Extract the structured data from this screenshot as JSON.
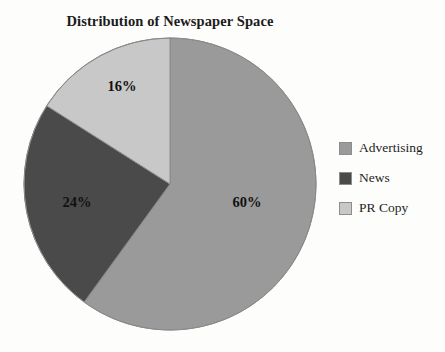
{
  "chart_data": {
    "type": "pie",
    "title": "Distribution of Newspaper Space",
    "categories": [
      "Advertising",
      "News",
      "PR Copy"
    ],
    "values": [
      60,
      24,
      16
    ],
    "value_labels": [
      "60%",
      "24%",
      "16%"
    ],
    "units": "percent",
    "total": 100,
    "start_angle_deg": 0,
    "direction": "clockwise",
    "legend_position": "right",
    "grid": false,
    "xlabel": "",
    "ylabel": "",
    "slices": [
      {
        "name": "Advertising",
        "value": 60,
        "label": "60%",
        "color": "#9a9a9a",
        "start_deg": 0,
        "end_deg": 216,
        "label_x": 225,
        "label_y": 168
      },
      {
        "name": "News",
        "value": 24,
        "label": "24%",
        "color": "#4a4a4a",
        "start_deg": 216,
        "end_deg": 302.4,
        "label_x": 55,
        "label_y": 168
      },
      {
        "name": "PR Copy",
        "value": 16,
        "label": "16%",
        "color": "#c8c8c8",
        "start_deg": 302.4,
        "end_deg": 360,
        "label_x": 100,
        "label_y": 52
      }
    ]
  },
  "chart": {
    "title": "Distribution of Newspaper Space",
    "pie": {
      "center_x": 148,
      "center_y": 148,
      "radius": 146,
      "outline_color": "#8a8a8a"
    },
    "labels": {
      "advertising_pct": "60%",
      "news_pct": "24%",
      "prcopy_pct": "16%"
    }
  },
  "legend": {
    "items": [
      {
        "label": "Advertising",
        "color": "#9a9a9a"
      },
      {
        "label": "News",
        "color": "#4a4a4a"
      },
      {
        "label": "PR Copy",
        "color": "#c8c8c8"
      }
    ]
  },
  "colors": {
    "background": "#fdfdfc",
    "advertising": "#9a9a9a",
    "news": "#4a4a4a",
    "pr_copy": "#c8c8c8",
    "text": "#1b1b1b",
    "outline": "#8a8a8a"
  }
}
